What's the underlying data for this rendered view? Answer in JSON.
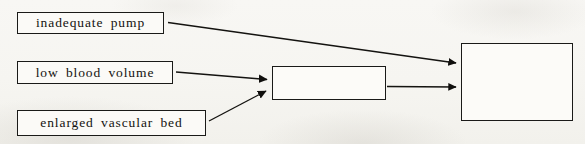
{
  "diagram": {
    "background_color": "#f7f6f2",
    "stroke_color": "#1a1a18",
    "nodes": [
      {
        "id": "inadequate-pump",
        "label": "inadequate pump",
        "type": "labeled-box",
        "x": 17,
        "y": 12,
        "width": 147,
        "height": 22
      },
      {
        "id": "low-blood-volume",
        "label": "low blood volume",
        "type": "labeled-box",
        "x": 17,
        "y": 61,
        "width": 156,
        "height": 23
      },
      {
        "id": "enlarged-vascular-bed",
        "label": "enlarged vascular bed",
        "type": "labeled-box",
        "x": 17,
        "y": 110,
        "width": 189,
        "height": 26
      },
      {
        "id": "middle-box",
        "label": "",
        "type": "blank-box",
        "x": 272,
        "y": 66,
        "width": 114,
        "height": 34
      },
      {
        "id": "right-box",
        "label": "",
        "type": "blank-box",
        "x": 461,
        "y": 43,
        "width": 112,
        "height": 78
      }
    ],
    "edges": [
      {
        "id": "pump-to-right",
        "from": "inadequate-pump",
        "to": "right-box",
        "arrowhead": true
      },
      {
        "id": "volume-to-middle",
        "from": "low-blood-volume",
        "to": "middle-box",
        "arrowhead": true
      },
      {
        "id": "bed-to-middle",
        "from": "enlarged-vascular-bed",
        "to": "middle-box",
        "arrowhead": true
      },
      {
        "id": "middle-to-right",
        "from": "middle-box",
        "to": "right-box",
        "arrowhead": true
      }
    ]
  }
}
